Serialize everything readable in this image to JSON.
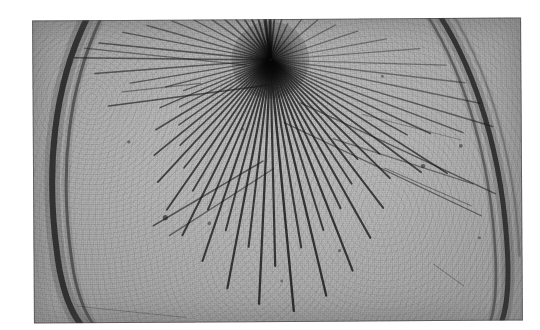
{
  "image": {
    "kind": "nuclear-emulsion-photomicrograph",
    "caption": "Nuclear emulsion / cloud chamber photograph of a high-energy star event",
    "description": "Grainy grey photographic print showing a dense dark vertex near the upper centre from which many straight ionisation tracks radiate outward; two heavy dark arcs curve along the left and right edges of the frame.",
    "width_px": 540,
    "height_px": 330
  },
  "print": {
    "x": 33,
    "y": 19,
    "width": 489,
    "height": 303,
    "rotation_deg": -0.35,
    "background_tone": "#bcbcbc",
    "border_color": "#3c3c3c",
    "paper_margin_color": "#ffffff"
  },
  "star": {
    "label": "interaction-vertex",
    "center_x": 238,
    "center_y": 41,
    "core_radius": 17,
    "core_color": "#1a1a1a"
  },
  "arcs": [
    {
      "name": "left-chamber-rim-outer",
      "d": "M 58 -8 C 22 60, 10 150, 26 250 C 34 292, 48 310, 62 318",
      "stroke": "#2a2a2a",
      "width": 6,
      "opacity": 0.92
    },
    {
      "name": "left-chamber-rim-inner",
      "d": "M 72 -8 C 36 62, 24 152, 40 252 C 48 294, 62 312, 76 320",
      "stroke": "#3a3a3a",
      "width": 3,
      "opacity": 0.68
    },
    {
      "name": "right-chamber-rim-outer",
      "d": "M 404 -8 C 444 52, 470 140, 474 236 C 476 284, 470 306, 460 318",
      "stroke": "#2a2a2a",
      "width": 5,
      "opacity": 0.9
    },
    {
      "name": "right-chamber-rim-inner",
      "d": "M 392 -8 C 432 54, 458 142, 462 238 C 464 286, 458 308, 448 320",
      "stroke": "#3c3c3c",
      "width": 2.5,
      "opacity": 0.62
    },
    {
      "name": "right-chamber-rim-faint",
      "d": "M 418 -8 C 458 56, 482 142, 486 238",
      "stroke": "#4a4a4a",
      "width": 2,
      "opacity": 0.42
    }
  ],
  "tracks": [
    {
      "angle_deg": -96,
      "length": 52,
      "width": 2.2,
      "opacity": 0.8
    },
    {
      "angle_deg": -90,
      "length": 50,
      "width": 3.0,
      "opacity": 0.88
    },
    {
      "angle_deg": -84,
      "length": 48,
      "width": 1.8,
      "opacity": 0.74
    },
    {
      "angle_deg": -74,
      "length": 44,
      "width": 1.5,
      "opacity": 0.66
    },
    {
      "angle_deg": -64,
      "length": 40,
      "width": 1.4,
      "opacity": 0.6
    },
    {
      "angle_deg": -52,
      "length": 56,
      "width": 1.3,
      "opacity": 0.56
    },
    {
      "angle_deg": -40,
      "length": 62,
      "width": 1.3,
      "opacity": 0.54
    },
    {
      "angle_deg": -28,
      "length": 74,
      "width": 1.2,
      "opacity": 0.48
    },
    {
      "angle_deg": -18,
      "length": 92,
      "width": 1.2,
      "opacity": 0.46
    },
    {
      "angle_deg": -10,
      "length": 118,
      "width": 1.1,
      "opacity": 0.42
    },
    {
      "angle_deg": -4,
      "length": 150,
      "width": 1.1,
      "opacity": 0.4
    },
    {
      "angle_deg": 2,
      "length": 176,
      "width": 1.2,
      "opacity": 0.42
    },
    {
      "angle_deg": 7,
      "length": 196,
      "width": 1.3,
      "opacity": 0.46
    },
    {
      "angle_deg": 12,
      "length": 214,
      "width": 1.3,
      "opacity": 0.5
    },
    {
      "angle_deg": 17,
      "length": 232,
      "width": 1.5,
      "opacity": 0.56
    },
    {
      "angle_deg": 21,
      "length": 206,
      "width": 1.4,
      "opacity": 0.58
    },
    {
      "angle_deg": 25,
      "length": 176,
      "width": 1.6,
      "opacity": 0.64
    },
    {
      "angle_deg": 29,
      "length": 156,
      "width": 1.6,
      "opacity": 0.66
    },
    {
      "angle_deg": 33,
      "length": 210,
      "width": 1.7,
      "opacity": 0.7
    },
    {
      "angle_deg": 37,
      "length": 188,
      "width": 1.8,
      "opacity": 0.72
    },
    {
      "angle_deg": 41,
      "length": 144,
      "width": 1.9,
      "opacity": 0.74
    },
    {
      "angle_deg": 45,
      "length": 168,
      "width": 2.0,
      "opacity": 0.76
    },
    {
      "angle_deg": 49,
      "length": 132,
      "width": 1.8,
      "opacity": 0.74
    },
    {
      "angle_deg": 53,
      "length": 186,
      "width": 2.0,
      "opacity": 0.78
    },
    {
      "angle_deg": 57,
      "length": 148,
      "width": 1.9,
      "opacity": 0.76
    },
    {
      "angle_deg": 61,
      "length": 204,
      "width": 2.1,
      "opacity": 0.8
    },
    {
      "angle_deg": 65,
      "length": 164,
      "width": 2.0,
      "opacity": 0.78
    },
    {
      "angle_deg": 69,
      "length": 226,
      "width": 2.2,
      "opacity": 0.82
    },
    {
      "angle_deg": 73,
      "length": 178,
      "width": 2.0,
      "opacity": 0.78
    },
    {
      "angle_deg": 77,
      "length": 242,
      "width": 2.3,
      "opacity": 0.84
    },
    {
      "angle_deg": 81,
      "length": 190,
      "width": 2.1,
      "opacity": 0.8
    },
    {
      "angle_deg": 85,
      "length": 252,
      "width": 2.4,
      "opacity": 0.86
    },
    {
      "angle_deg": 89,
      "length": 206,
      "width": 2.2,
      "opacity": 0.82
    },
    {
      "angle_deg": 93,
      "length": 244,
      "width": 2.3,
      "opacity": 0.84
    },
    {
      "angle_deg": 97,
      "length": 188,
      "width": 2.1,
      "opacity": 0.8
    },
    {
      "angle_deg": 101,
      "length": 232,
      "width": 2.2,
      "opacity": 0.82
    },
    {
      "angle_deg": 105,
      "length": 176,
      "width": 2.0,
      "opacity": 0.78
    },
    {
      "angle_deg": 109,
      "length": 212,
      "width": 2.1,
      "opacity": 0.8
    },
    {
      "angle_deg": 113,
      "length": 162,
      "width": 1.9,
      "opacity": 0.76
    },
    {
      "angle_deg": 117,
      "length": 196,
      "width": 2.0,
      "opacity": 0.78
    },
    {
      "angle_deg": 121,
      "length": 152,
      "width": 1.8,
      "opacity": 0.74
    },
    {
      "angle_deg": 125,
      "length": 182,
      "width": 1.9,
      "opacity": 0.76
    },
    {
      "angle_deg": 129,
      "length": 138,
      "width": 1.7,
      "opacity": 0.72
    },
    {
      "angle_deg": 133,
      "length": 166,
      "width": 1.8,
      "opacity": 0.74
    },
    {
      "angle_deg": 137,
      "length": 124,
      "width": 1.6,
      "opacity": 0.7
    },
    {
      "angle_deg": 141,
      "length": 150,
      "width": 1.7,
      "opacity": 0.72
    },
    {
      "angle_deg": 145,
      "length": 112,
      "width": 1.5,
      "opacity": 0.66
    },
    {
      "angle_deg": 149,
      "length": 134,
      "width": 1.6,
      "opacity": 0.68
    },
    {
      "angle_deg": 153,
      "length": 102,
      "width": 1.4,
      "opacity": 0.62
    },
    {
      "angle_deg": 157,
      "length": 120,
      "width": 1.5,
      "opacity": 0.64
    },
    {
      "angle_deg": 161,
      "length": 92,
      "width": 1.3,
      "opacity": 0.58
    },
    {
      "angle_deg": 166,
      "length": 108,
      "width": 1.4,
      "opacity": 0.6
    },
    {
      "angle_deg": 171,
      "length": 142,
      "width": 1.4,
      "opacity": 0.58
    },
    {
      "angle_deg": 176,
      "length": 176,
      "width": 1.5,
      "opacity": 0.6
    },
    {
      "angle_deg": 181,
      "length": 196,
      "width": 1.6,
      "opacity": 0.62
    },
    {
      "angle_deg": 186,
      "length": 172,
      "width": 1.5,
      "opacity": 0.6
    },
    {
      "angle_deg": 191,
      "length": 150,
      "width": 1.4,
      "opacity": 0.58
    },
    {
      "angle_deg": 196,
      "length": 128,
      "width": 1.4,
      "opacity": 0.56
    },
    {
      "angle_deg": 202,
      "length": 106,
      "width": 1.3,
      "opacity": 0.54
    },
    {
      "angle_deg": 208,
      "length": 88,
      "width": 1.3,
      "opacity": 0.54
    },
    {
      "angle_deg": 215,
      "length": 72,
      "width": 1.4,
      "opacity": 0.58
    },
    {
      "angle_deg": 222,
      "length": 62,
      "width": 1.5,
      "opacity": 0.62
    },
    {
      "angle_deg": 230,
      "length": 56,
      "width": 1.6,
      "opacity": 0.66
    },
    {
      "angle_deg": 238,
      "length": 52,
      "width": 1.8,
      "opacity": 0.7
    },
    {
      "angle_deg": 246,
      "length": 50,
      "width": 2.0,
      "opacity": 0.74
    },
    {
      "angle_deg": 254,
      "length": 48,
      "width": 2.0,
      "opacity": 0.76
    },
    {
      "angle_deg": 262,
      "length": 46,
      "width": 2.2,
      "opacity": 0.8
    }
  ],
  "stray_tracks": [
    {
      "name": "stray-upper-left-long",
      "x1": 52,
      "y1": 28,
      "x2": 214,
      "y2": 46,
      "width": 1.3,
      "opacity": 0.52
    },
    {
      "name": "stray-left-horizontal",
      "x1": 76,
      "y1": 86,
      "x2": 236,
      "y2": 66,
      "width": 1.6,
      "opacity": 0.7
    },
    {
      "name": "stray-left-short",
      "x1": 90,
      "y1": 72,
      "x2": 168,
      "y2": 64,
      "width": 1.2,
      "opacity": 0.46
    },
    {
      "name": "stray-right-long-1",
      "x1": 268,
      "y1": 84,
      "x2": 462,
      "y2": 176,
      "width": 1.4,
      "opacity": 0.62
    },
    {
      "name": "stray-right-long-2",
      "x1": 252,
      "y1": 104,
      "x2": 448,
      "y2": 198,
      "width": 1.3,
      "opacity": 0.58
    },
    {
      "name": "stray-right-long-3",
      "x1": 300,
      "y1": 120,
      "x2": 440,
      "y2": 166,
      "width": 1.2,
      "opacity": 0.5
    },
    {
      "name": "stray-right-fine",
      "x1": 330,
      "y1": 96,
      "x2": 428,
      "y2": 122,
      "width": 1.0,
      "opacity": 0.38
    },
    {
      "name": "stray-lower-right",
      "x1": 352,
      "y1": 150,
      "x2": 438,
      "y2": 188,
      "width": 1.1,
      "opacity": 0.44
    },
    {
      "name": "stray-lower-left-1",
      "x1": 120,
      "y1": 206,
      "x2": 230,
      "y2": 142,
      "width": 1.5,
      "opacity": 0.66
    },
    {
      "name": "stray-lower-left-2",
      "x1": 136,
      "y1": 216,
      "x2": 240,
      "y2": 150,
      "width": 1.3,
      "opacity": 0.58
    },
    {
      "name": "stray-bottom-scratch",
      "x1": 44,
      "y1": 286,
      "x2": 152,
      "y2": 298,
      "width": 1.0,
      "opacity": 0.3
    },
    {
      "name": "stray-right-edge-tick",
      "x1": 400,
      "y1": 246,
      "x2": 430,
      "y2": 268,
      "width": 1.0,
      "opacity": 0.34
    }
  ],
  "blobs": [
    {
      "name": "grain-blob-a",
      "cx": 132,
      "cy": 198,
      "r": 2.6,
      "opacity": 0.62
    },
    {
      "name": "grain-blob-b",
      "cx": 390,
      "cy": 148,
      "r": 2.2,
      "opacity": 0.58
    },
    {
      "name": "grain-blob-c",
      "cx": 428,
      "cy": 128,
      "r": 1.9,
      "opacity": 0.52
    },
    {
      "name": "grain-blob-d",
      "cx": 176,
      "cy": 204,
      "r": 1.8,
      "opacity": 0.5
    },
    {
      "name": "grain-blob-e",
      "cx": 306,
      "cy": 232,
      "r": 1.6,
      "opacity": 0.46
    },
    {
      "name": "grain-blob-f",
      "cx": 96,
      "cy": 122,
      "r": 1.7,
      "opacity": 0.48
    },
    {
      "name": "grain-blob-g",
      "cx": 248,
      "cy": 262,
      "r": 1.5,
      "opacity": 0.42
    },
    {
      "name": "grain-blob-h",
      "cx": 446,
      "cy": 220,
      "r": 1.6,
      "opacity": 0.44
    },
    {
      "name": "grain-blob-i",
      "cx": 210,
      "cy": 110,
      "r": 1.4,
      "opacity": 0.4
    },
    {
      "name": "grain-blob-j",
      "cx": 350,
      "cy": 58,
      "r": 1.5,
      "opacity": 0.42
    }
  ]
}
